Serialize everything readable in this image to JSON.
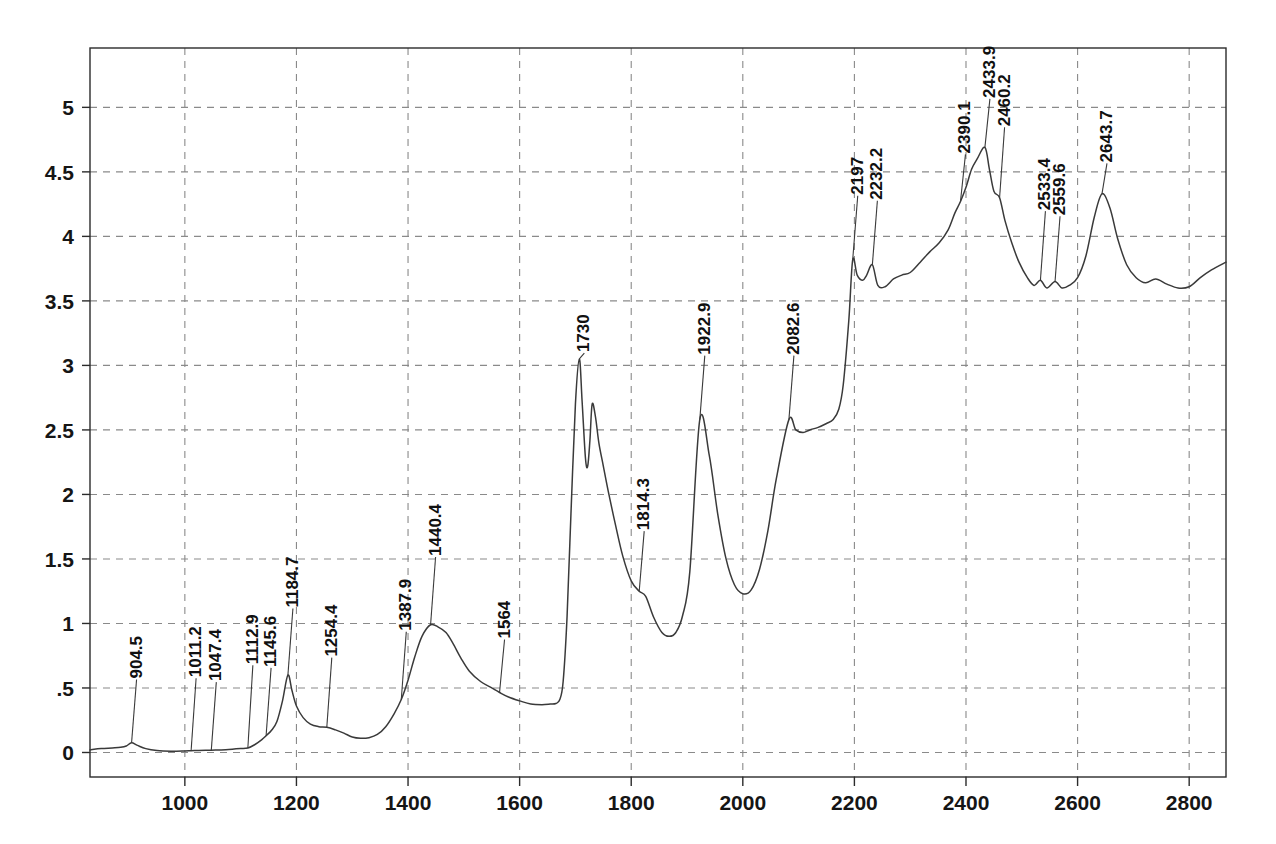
{
  "chart_data": {
    "type": "line",
    "title": "",
    "subtitle": "",
    "xlabel": "",
    "ylabel": "",
    "xlim": [
      830,
      2866
    ],
    "ylim": [
      -0.19,
      5.46
    ],
    "grid": true,
    "legend": "none",
    "x_ticks": [
      1000,
      1200,
      1400,
      1600,
      1800,
      2000,
      2200,
      2400,
      2600,
      2800
    ],
    "x_tick_labels": [
      "1000",
      "1200",
      "1400",
      "1600",
      "1800",
      "2000",
      "2200",
      "2400",
      "2600",
      "2800"
    ],
    "y_ticks": [
      0,
      0.5,
      1,
      1.5,
      2,
      2.5,
      3,
      3.5,
      4,
      4.5,
      5
    ],
    "y_tick_labels": [
      "0",
      ".5",
      "1",
      "1.5",
      "2",
      "2.5",
      "3",
      "3.5",
      "4",
      "4.5",
      "5"
    ],
    "curve_color": "#3a3a3a",
    "grid_color": "#8a8a8a",
    "axis_color": "#2b2b2b",
    "series": [
      {
        "name": "spectrum",
        "x": [
          830,
          850,
          870,
          885,
          895,
          904.5,
          915,
          930,
          950,
          975,
          1000,
          1011.2,
          1025,
          1047.4,
          1065,
          1085,
          1100,
          1112.9,
          1125,
          1138,
          1145.6,
          1155,
          1165,
          1175,
          1184.7,
          1192,
          1200,
          1212,
          1225,
          1240,
          1254.4,
          1270,
          1285,
          1300,
          1315,
          1330,
          1345,
          1360,
          1375,
          1387.9,
          1400,
          1412,
          1425,
          1440.4,
          1455,
          1468,
          1480,
          1495,
          1510,
          1530,
          1550,
          1564,
          1580,
          1600,
          1620,
          1640,
          1655,
          1665,
          1672,
          1678,
          1685,
          1692,
          1700,
          1707,
          1712,
          1718,
          1722,
          1726,
          1730,
          1736,
          1742,
          1750,
          1760,
          1772,
          1785,
          1800,
          1814.3,
          1826,
          1840,
          1855,
          1868,
          1880,
          1892,
          1905,
          1922.9,
          1940,
          1955,
          1970,
          1985,
          2000,
          2015,
          2030,
          2045,
          2060,
          2082.6,
          2095,
          2108,
          2120,
          2135,
          2150,
          2162,
          2172,
          2180,
          2190,
          2197,
          2205,
          2215,
          2222,
          2232.2,
          2242,
          2255,
          2270,
          2285,
          2300,
          2318,
          2335,
          2352,
          2368,
          2380,
          2390.1,
          2400,
          2410,
          2420,
          2433.9,
          2442,
          2450,
          2460.2,
          2470,
          2482,
          2495,
          2510,
          2522,
          2533.4,
          2545,
          2559.6,
          2572,
          2585,
          2600,
          2615,
          2630,
          2643.7,
          2658,
          2672,
          2688,
          2705,
          2722,
          2740,
          2760,
          2780,
          2800,
          2820,
          2840,
          2866
        ],
        "y": [
          0.02,
          0.03,
          0.035,
          0.04,
          0.05,
          0.075,
          0.055,
          0.03,
          0.015,
          0.01,
          0.012,
          0.014,
          0.015,
          0.018,
          0.02,
          0.025,
          0.03,
          0.035,
          0.06,
          0.1,
          0.13,
          0.17,
          0.24,
          0.4,
          0.6,
          0.48,
          0.36,
          0.27,
          0.22,
          0.2,
          0.195,
          0.175,
          0.15,
          0.12,
          0.11,
          0.115,
          0.14,
          0.2,
          0.3,
          0.41,
          0.56,
          0.74,
          0.9,
          0.99,
          0.97,
          0.93,
          0.85,
          0.73,
          0.63,
          0.55,
          0.5,
          0.465,
          0.43,
          0.4,
          0.375,
          0.37,
          0.375,
          0.38,
          0.41,
          0.55,
          1.05,
          1.85,
          2.7,
          3.05,
          2.72,
          2.28,
          2.22,
          2.42,
          2.7,
          2.6,
          2.4,
          2.22,
          2.0,
          1.76,
          1.52,
          1.33,
          1.25,
          1.21,
          1.05,
          0.93,
          0.9,
          0.93,
          1.06,
          1.4,
          2.58,
          2.3,
          1.85,
          1.5,
          1.3,
          1.23,
          1.26,
          1.42,
          1.72,
          2.12,
          2.58,
          2.5,
          2.48,
          2.5,
          2.52,
          2.55,
          2.58,
          2.66,
          2.85,
          3.35,
          3.82,
          3.7,
          3.66,
          3.7,
          3.78,
          3.62,
          3.61,
          3.67,
          3.7,
          3.72,
          3.8,
          3.88,
          3.95,
          4.05,
          4.18,
          4.27,
          4.38,
          4.52,
          4.6,
          4.69,
          4.52,
          4.35,
          4.3,
          4.12,
          3.95,
          3.8,
          3.68,
          3.62,
          3.66,
          3.6,
          3.65,
          3.6,
          3.62,
          3.68,
          3.85,
          4.15,
          4.33,
          4.22,
          3.98,
          3.78,
          3.68,
          3.64,
          3.67,
          3.63,
          3.6,
          3.61,
          3.68,
          3.74,
          3.8
        ]
      }
    ],
    "annotations": [
      {
        "label": "904.5",
        "x": 904.5,
        "y": 0.075,
        "label_y_top": 0.55
      },
      {
        "label": "1011.2",
        "x": 1011.2,
        "y": 0.014,
        "label_y_top": 0.56
      },
      {
        "label": "1047.4",
        "x": 1047.4,
        "y": 0.018,
        "label_y_top": 0.53
      },
      {
        "label": "1112.9",
        "x": 1112.9,
        "y": 0.035,
        "label_y_top": 0.66
      },
      {
        "label": "1145.6",
        "x": 1145.6,
        "y": 0.13,
        "label_y_top": 0.64
      },
      {
        "label": "1184.7",
        "x": 1184.7,
        "y": 0.6,
        "label_y_top": 1.1
      },
      {
        "label": "1254.4",
        "x": 1254.4,
        "y": 0.195,
        "label_y_top": 0.72
      },
      {
        "label": "1387.9",
        "x": 1387.9,
        "y": 0.41,
        "label_y_top": 0.92
      },
      {
        "label": "1440.4",
        "x": 1440.4,
        "y": 0.99,
        "label_y_top": 1.5
      },
      {
        "label": "1564",
        "x": 1564,
        "y": 0.465,
        "label_y_top": 0.86
      },
      {
        "label": "1730",
        "x": 1707,
        "y": 3.05,
        "label_y_top": 3.08
      },
      {
        "label": "1814.3",
        "x": 1814.3,
        "y": 1.25,
        "label_y_top": 1.7
      },
      {
        "label": "1922.9",
        "x": 1922.9,
        "y": 2.58,
        "label_y_top": 3.06
      },
      {
        "label": "2082.6",
        "x": 2082.6,
        "y": 2.58,
        "label_y_top": 3.06
      },
      {
        "label": "2197",
        "x": 2197,
        "y": 3.82,
        "label_y_top": 4.3
      },
      {
        "label": "2232.2",
        "x": 2232.2,
        "y": 3.78,
        "label_y_top": 4.26
      },
      {
        "label": "2390.1",
        "x": 2390.1,
        "y": 4.27,
        "label_y_top": 4.62
      },
      {
        "label": "2433.9",
        "x": 2433.9,
        "y": 4.69,
        "label_y_top": 5.05
      },
      {
        "label": "2460.2",
        "x": 2460.2,
        "y": 4.3,
        "label_y_top": 4.83
      },
      {
        "label": "2533.4",
        "x": 2533.4,
        "y": 3.66,
        "label_y_top": 4.18
      },
      {
        "label": "2559.6",
        "x": 2559.6,
        "y": 3.65,
        "label_y_top": 4.14
      },
      {
        "label": "2643.7",
        "x": 2643.7,
        "y": 4.33,
        "label_y_top": 4.55
      }
    ]
  }
}
